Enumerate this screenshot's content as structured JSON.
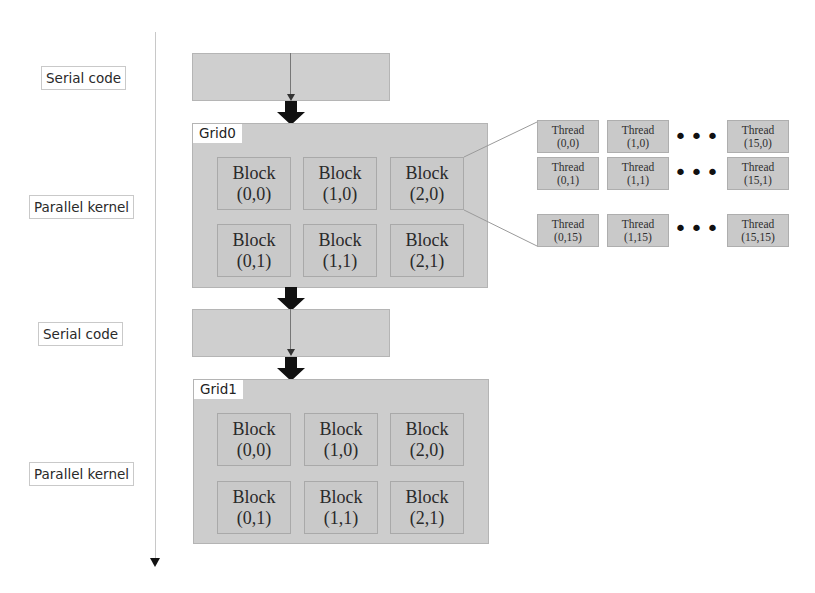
{
  "timeline": {
    "labels": [
      {
        "text": "Serial code",
        "kind": "serial"
      },
      {
        "text": "Parallel kernel",
        "kind": "parallel"
      },
      {
        "text": "Serial code",
        "kind": "serial"
      },
      {
        "text": "Parallel kernel",
        "kind": "parallel"
      }
    ]
  },
  "grids": [
    {
      "name": "Grid0",
      "blocks": [
        {
          "label": "Block",
          "coord": "(0,0)"
        },
        {
          "label": "Block",
          "coord": "(1,0)"
        },
        {
          "label": "Block",
          "coord": "(2,0)"
        },
        {
          "label": "Block",
          "coord": "(0,1)"
        },
        {
          "label": "Block",
          "coord": "(1,1)"
        },
        {
          "label": "Block",
          "coord": "(2,1)"
        }
      ]
    },
    {
      "name": "Grid1",
      "blocks": [
        {
          "label": "Block",
          "coord": "(0,0)"
        },
        {
          "label": "Block",
          "coord": "(1,0)"
        },
        {
          "label": "Block",
          "coord": "(2,0)"
        },
        {
          "label": "Block",
          "coord": "(0,1)"
        },
        {
          "label": "Block",
          "coord": "(1,1)"
        },
        {
          "label": "Block",
          "coord": "(2,1)"
        }
      ]
    }
  ],
  "thread_detail": {
    "expanded_block": "Grid0 Block (2,0)",
    "rows": [
      {
        "threads": [
          {
            "label": "Thread",
            "coord": "(0,0)"
          },
          {
            "label": "Thread",
            "coord": "(1,0)"
          },
          {
            "label": "Thread",
            "coord": "(15,0)"
          }
        ],
        "ellipsis": "•••"
      },
      {
        "threads": [
          {
            "label": "Thread",
            "coord": "(0,1)"
          },
          {
            "label": "Thread",
            "coord": "(1,1)"
          },
          {
            "label": "Thread",
            "coord": "(15,1)"
          }
        ],
        "ellipsis": "•••"
      },
      {
        "threads": [
          {
            "label": "Thread",
            "coord": "(0,15)"
          },
          {
            "label": "Thread",
            "coord": "(1,15)"
          },
          {
            "label": "Thread",
            "coord": "(15,15)"
          }
        ],
        "ellipsis": "•••"
      }
    ]
  },
  "colors": {
    "box_fill": "#cdcdcd",
    "box_border": "#b4b4b4",
    "arrow": "#111111",
    "label_border": "#c9c9c9"
  }
}
